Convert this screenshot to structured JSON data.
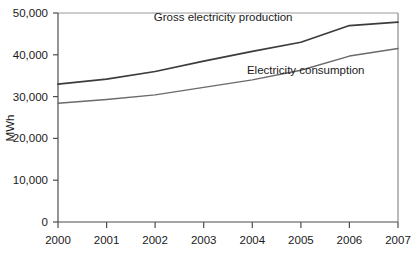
{
  "chart_data": {
    "type": "line",
    "title": "",
    "xlabel": "",
    "ylabel": "MWh",
    "x": [
      2000,
      2001,
      2002,
      2003,
      2004,
      2005,
      2006,
      2007
    ],
    "xticklabels": [
      "2000",
      "2001",
      "2002",
      "2003",
      "2004",
      "2005",
      "2006",
      "2007"
    ],
    "yticks": [
      0,
      10000,
      20000,
      30000,
      40000,
      50000
    ],
    "yticklabels": [
      "0",
      "10,000",
      "20,000",
      "30,000",
      "40,000",
      "50,000"
    ],
    "ylim": [
      0,
      50000
    ],
    "xlim": [
      2000,
      2007
    ],
    "grid": false,
    "legend_position": "inline-annotations",
    "series": [
      {
        "name": "Gross electricity production",
        "color": "#3c3c3c",
        "values": [
          33000,
          34200,
          36000,
          38500,
          40800,
          43000,
          47000,
          47800
        ]
      },
      {
        "name": "Electricity consumption",
        "color": "#6a6a6a",
        "values": [
          28400,
          29300,
          30400,
          32200,
          34000,
          36300,
          39700,
          41500
        ]
      }
    ],
    "annotations": [
      {
        "text": "Gross electricity production",
        "x": 2003.4,
        "y": 48200
      },
      {
        "text": "Electricity consumption",
        "x": 2005.1,
        "y": 35400
      }
    ]
  },
  "axes": {
    "y_axis_title": "MWh",
    "y_tick_0": "0",
    "y_tick_1": "10,000",
    "y_tick_2": "20,000",
    "y_tick_3": "30,000",
    "y_tick_4": "40,000",
    "y_tick_5": "50,000",
    "x_tick_0": "2000",
    "x_tick_1": "2001",
    "x_tick_2": "2002",
    "x_tick_3": "2003",
    "x_tick_4": "2004",
    "x_tick_5": "2005",
    "x_tick_6": "2006",
    "x_tick_7": "2007"
  },
  "labels": {
    "production": "Gross electricity production",
    "consumption": "Electricity consumption"
  },
  "colors": {
    "production_line": "#3c3c3c",
    "consumption_line": "#6a6a6a",
    "axis": "#4d4d4d",
    "frame": "#8c8c8c",
    "background": "#ffffff"
  }
}
